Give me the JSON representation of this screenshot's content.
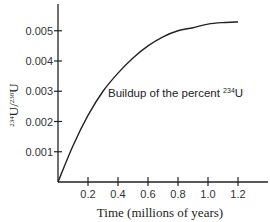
{
  "chart_data": {
    "type": "line",
    "title": "",
    "xlabel": "Time (millions of years)",
    "ylabel": "234U/238U",
    "ylabel_parts": {
      "iso1": "234",
      "el1": "U/",
      "iso2": "238",
      "el2": "U"
    },
    "xlim": [
      0,
      1.3
    ],
    "ylim": [
      0,
      0.0058
    ],
    "x_ticks": [
      "0.2",
      "0.4",
      "0.6",
      "0.8",
      "1.0",
      "1.2"
    ],
    "y_ticks": [
      "0.001",
      "0.002",
      "0.003",
      "0.004",
      "0.005"
    ],
    "grid": false,
    "legend": null,
    "annotation": {
      "text": "Buildup of the percent ",
      "iso": "234",
      "el": "U"
    },
    "series": [
      {
        "name": "Buildup of the percent 234U",
        "x": [
          0,
          0.1,
          0.2,
          0.3,
          0.4,
          0.5,
          0.6,
          0.7,
          0.8,
          0.9,
          1.0,
          1.1,
          1.2
        ],
        "values": [
          0,
          0.0012,
          0.0022,
          0.003,
          0.0036,
          0.0041,
          0.0045,
          0.0048,
          0.005,
          0.0051,
          0.00522,
          0.00527,
          0.00529
        ]
      }
    ]
  }
}
